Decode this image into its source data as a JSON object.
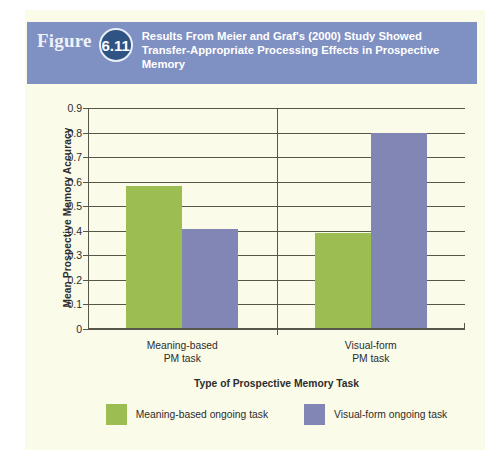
{
  "figure": {
    "label": "Figure",
    "number": "6.11",
    "caption": "Results From Meier and Graf's (2000) Study Showed Transfer-Appropriate Processing Effects in Prospective Memory",
    "banner_color": "#7f90c2",
    "circle_color": "#2f5383",
    "panel_color": "#fbfbea"
  },
  "chart_data": {
    "type": "bar",
    "title": "Results From Meier and Graf's (2000) Study Showed Transfer-Appropriate Processing Effects in Prospective Memory",
    "xlabel": "Type of Prospective Memory Task",
    "ylabel": "Mean Prospective Memory Accuracy",
    "categories": [
      "Meaning-based PM task",
      "Visual-form PM task"
    ],
    "series": [
      {
        "name": "Meaning-based ongoing task",
        "color": "#9cbd52",
        "values": [
          0.58,
          0.385
        ]
      },
      {
        "name": "Visual-form ongoing task",
        "color": "#8186b5",
        "values": [
          0.405,
          0.795
        ]
      }
    ],
    "ylim": [
      0,
      0.9
    ],
    "yticks": [
      "0.9",
      "0.8",
      "0.7",
      "0.6",
      "0.5",
      "0.4",
      "0.3",
      "0.2",
      "0.1",
      "0"
    ],
    "ytick_values": [
      0.9,
      0.8,
      0.7,
      0.6,
      0.5,
      0.4,
      0.3,
      0.2,
      0.1,
      0
    ],
    "grid": true,
    "legend_position": "bottom"
  }
}
